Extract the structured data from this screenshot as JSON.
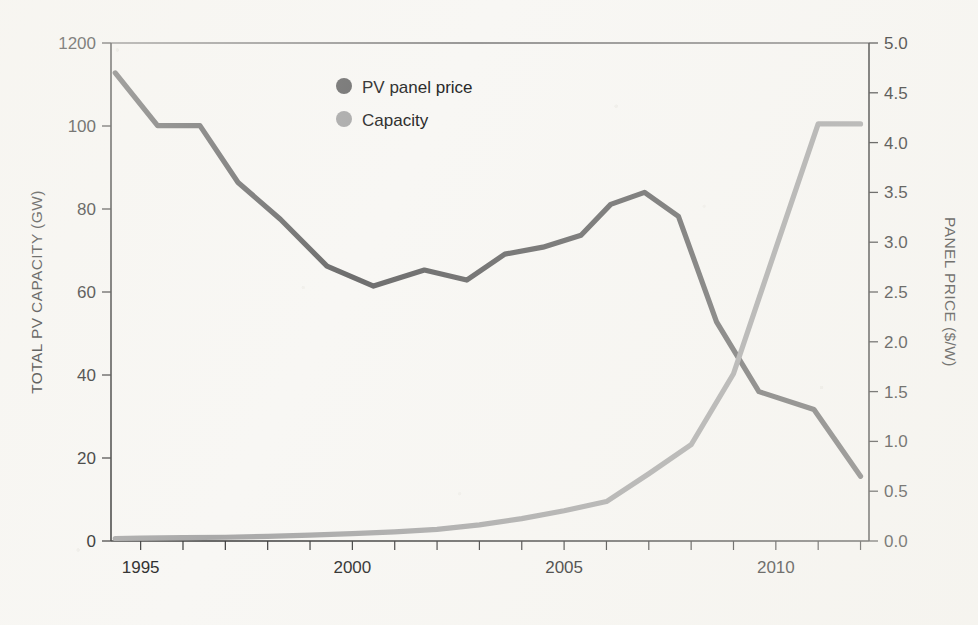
{
  "chart_data": {
    "type": "line",
    "title": "",
    "xlabel": "",
    "ylabel": "TOTAL PV CAPACITY (GW)",
    "y2label": "PANEL PRICE ($/W)",
    "xlim": [
      1994.3,
      2012.2
    ],
    "ylim": [
      0,
      120
    ],
    "y2lim": [
      0.0,
      5.0
    ],
    "grid": false,
    "legend_position": "top-center",
    "x_tick_labels": [
      "1995",
      "2000",
      "2005",
      "2010"
    ],
    "x_tick_values": [
      1995,
      2000,
      2005,
      2010
    ],
    "x_minor_ticks": [
      1995,
      1996,
      1997,
      1998,
      1999,
      2000,
      2001,
      2002,
      2003,
      2004,
      2005,
      2006,
      2007,
      2008,
      2009,
      2010,
      2011,
      2012
    ],
    "y_tick_labels": [
      "1200",
      "100",
      "80",
      "60",
      "40",
      "20",
      "0"
    ],
    "y_tick_values": [
      120,
      100,
      80,
      60,
      40,
      20,
      0
    ],
    "y2_tick_labels": [
      "5.0",
      "4.5",
      "4.0",
      "3.5",
      "3.0",
      "2.5",
      "2.0",
      "1.5",
      "1.0",
      "0.5",
      "0.0"
    ],
    "y2_tick_values": [
      5.0,
      4.5,
      4.0,
      3.5,
      3.0,
      2.5,
      2.0,
      1.5,
      1.0,
      0.5,
      0.0
    ],
    "series": [
      {
        "name": "PV panel price",
        "axis": "right",
        "unit": "$/W",
        "color": "#6e6e6e",
        "x": [
          1994.4,
          1995.4,
          1996.4,
          1997.3,
          1998.3,
          1999.4,
          2000.5,
          2001.7,
          2002.7,
          2003.6,
          2004.5,
          2005.4,
          2006.1,
          2006.9,
          2007.7,
          2008.6,
          2009.6,
          2010.9,
          2012.0
        ],
        "values": [
          4.7,
          4.17,
          4.17,
          3.6,
          3.23,
          2.76,
          2.56,
          2.72,
          2.62,
          2.88,
          2.95,
          3.07,
          3.38,
          3.5,
          3.26,
          2.2,
          1.5,
          1.32,
          0.65
        ]
      },
      {
        "name": "Capacity",
        "axis": "left",
        "unit": "GW",
        "color": "#a9a9a9",
        "x": [
          1994.4,
          1995,
          1996,
          1997,
          1998,
          1999,
          2000,
          2001,
          2002,
          2003,
          2004,
          2005,
          2006,
          2007,
          2008,
          2009,
          2010,
          2011,
          2012
        ],
        "values": [
          0.6,
          0.7,
          0.8,
          0.9,
          1.1,
          1.4,
          1.8,
          2.2,
          2.8,
          3.9,
          5.4,
          7.3,
          9.5,
          16.2,
          23.2,
          40.3,
          70.5,
          100.5,
          100.5
        ]
      }
    ],
    "legend": [
      {
        "label": "PV panel price",
        "color": "#6e6e6e",
        "marker": "circle"
      },
      {
        "label": "Capacity",
        "color": "#a9a9a9",
        "marker": "circle"
      }
    ],
    "colors": {
      "background": "#f8f7f4",
      "axis": "#3a3a3a",
      "text": "#272727",
      "price_line": "#6e6e6e",
      "capacity_line": "#a9a9a9"
    }
  }
}
